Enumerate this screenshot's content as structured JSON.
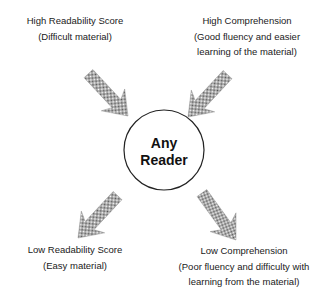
{
  "diagram": {
    "center": {
      "line1": "Any",
      "line2": "Reader"
    },
    "nodes": [
      {
        "id": "top-left",
        "title": "High Readability Score",
        "subtitle_lines": [
          "(Difficult material)"
        ],
        "arrow_direction": "toward-center"
      },
      {
        "id": "top-right",
        "title": "High Comprehension",
        "subtitle_lines": [
          "(Good fluency and easier",
          "learning of the material)"
        ],
        "arrow_direction": "toward-center"
      },
      {
        "id": "bottom-left",
        "title": "Low Readability Score",
        "subtitle_lines": [
          "(Easy material)"
        ],
        "arrow_direction": "away-from-center"
      },
      {
        "id": "bottom-right",
        "title": "Low Comprehension",
        "subtitle_lines": [
          "(Poor fluency and difficulty with",
          "learning from  the material)"
        ],
        "arrow_direction": "away-from-center"
      }
    ],
    "colors": {
      "arrow_fill": "#8a8a8a",
      "circle_stroke": "#222222",
      "text": "#1a1a1a"
    }
  }
}
